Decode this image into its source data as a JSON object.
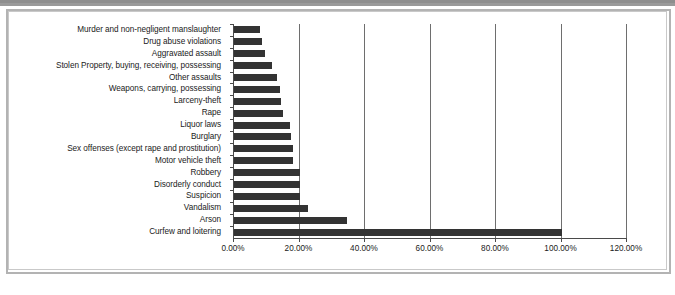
{
  "chart_data": {
    "type": "bar",
    "orientation": "horizontal",
    "title": "",
    "subtitle": "",
    "xlabel": "",
    "ylabel": "",
    "xlim": [
      0,
      120
    ],
    "xtick_values": [
      0,
      20,
      40,
      60,
      80,
      100,
      120
    ],
    "xtick_labels": [
      "0.00%",
      "20.00%",
      "40.00%",
      "60.00%",
      "80.00%",
      "100.00%",
      "120.00%"
    ],
    "grid": true,
    "grid_axis": "x",
    "legend": false,
    "legend_position": "none",
    "bar_color": "#333333",
    "categories": [
      "Murder and non-negligent manslaughter",
      "Drug abuse violations",
      "Aggravated assault",
      "Stolen Property, buying, receiving, possessing",
      "Other assaults",
      "Weapons, carrying, possessing",
      "Larceny-theft",
      "Rape",
      "Liquor laws",
      "Burglary",
      "Sex offenses (except rape and prostitution)",
      "Motor vehicle theft",
      "Robbery",
      "Disorderly conduct",
      "Suspicion",
      "Vandalism",
      "Arson",
      "Curfew and loitering"
    ],
    "values": [
      8.0,
      8.5,
      9.5,
      11.5,
      13.0,
      14.0,
      14.5,
      15.0,
      17.0,
      17.5,
      18.0,
      18.0,
      20.0,
      20.0,
      20.0,
      22.5,
      34.5,
      100.0
    ],
    "value_labels": [
      "8.00%",
      "8.50%",
      "9.50%",
      "11.50%",
      "13.00%",
      "14.00%",
      "14.50%",
      "15.00%",
      "17.00%",
      "17.50%",
      "18.00%",
      "18.00%",
      "20.00%",
      "20.00%",
      "20.00%",
      "22.50%",
      "34.50%",
      "100.00%"
    ]
  },
  "colors": {
    "bar": "#333333",
    "gridline": "#6e6e6e",
    "axis": "#4a4a4a",
    "frame_border": "#b3b3b3",
    "top_band": "#9a9a9a",
    "background": "#ffffff",
    "text": "#1a1a1a"
  }
}
